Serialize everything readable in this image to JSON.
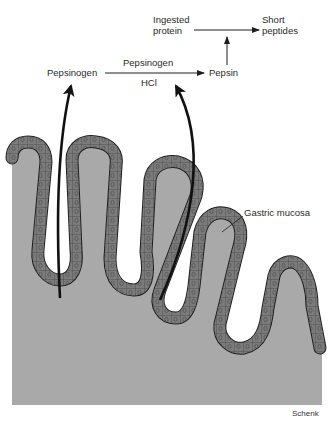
{
  "figure": {
    "type": "diagram",
    "colors": {
      "background": "#ffffff",
      "stroma": "#a9a9a9",
      "epithelium": "#7c7c7c",
      "outline": "#1e1e1e",
      "text": "#2a2a2a"
    }
  },
  "labels": {
    "ingested_protein_line1": "Ingested",
    "ingested_protein_line2": "protein",
    "short_peptides_line1": "Short",
    "short_peptides_line2": "peptides",
    "pepsinogen_left": "Pepsinogen",
    "pepsinogen_over_arrow": "Pepsinogen",
    "hcl_under_arrow": "HCl",
    "pepsin": "Pepsin",
    "gastric_mucosa": "Gastric mucosa",
    "credit": "Schenk"
  },
  "pathway": [
    {
      "from": "Pepsinogen",
      "to": "Pepsin",
      "catalysts": [
        "Pepsinogen",
        "HCl"
      ]
    },
    {
      "from": "Ingested protein",
      "to": "Short peptides",
      "enzyme": "Pepsin"
    }
  ]
}
